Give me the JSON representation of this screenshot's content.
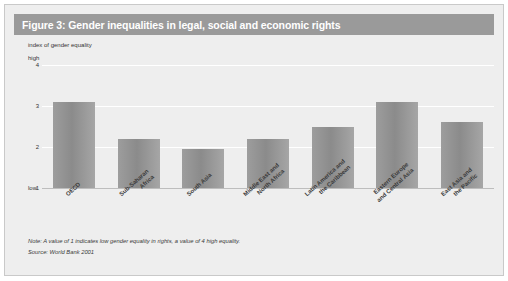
{
  "figure": {
    "title": "Figure 3: Gender inequalities in legal, social and economic rights",
    "title_bar_color": "#9a9a9a",
    "panel_color": "#eeeeee",
    "bar_color": "#8f8f8f"
  },
  "notes": {
    "note": "Note: A value of 1 indicates low gender equality in rights, a value of 4 high equality.",
    "source": "Source: World Bank 2001"
  },
  "axis": {
    "y_caption": "index of gender equality",
    "high_label": "high",
    "low_label": "low",
    "ticks": [
      "4",
      "3",
      "2",
      "1"
    ]
  },
  "chart_data": {
    "type": "bar",
    "title": "Figure 3: Gender inequalities in legal, social and economic rights",
    "xlabel": "",
    "ylabel": "index of gender equality",
    "ylim": [
      1,
      4
    ],
    "yticks": [
      1,
      2,
      3,
      4
    ],
    "grid": true,
    "legend": "none",
    "categories": [
      "OECD",
      "Sub-Saharan Africa",
      "South Asia",
      "Middle East and North Africa",
      "Latin America and the Caribbean",
      "Eastern Europe and Central Asia",
      "East Asia and the Pacific"
    ],
    "category_lines": [
      [
        "OECD"
      ],
      [
        "Sub-Saharan",
        "Africa"
      ],
      [
        "South Asia"
      ],
      [
        "Middle East and",
        "North Africa"
      ],
      [
        "Latin America and",
        "the Caribbean"
      ],
      [
        "Eastern Europe",
        "and Central Asia"
      ],
      [
        "East Asia and",
        "the Pacific"
      ]
    ],
    "values": [
      3.1,
      2.2,
      1.95,
      2.2,
      2.5,
      3.1,
      2.6
    ],
    "annotations": [
      "Note: A value of 1 indicates low gender equality in rights, a value of 4 high equality.",
      "Source: World Bank 2001"
    ]
  }
}
